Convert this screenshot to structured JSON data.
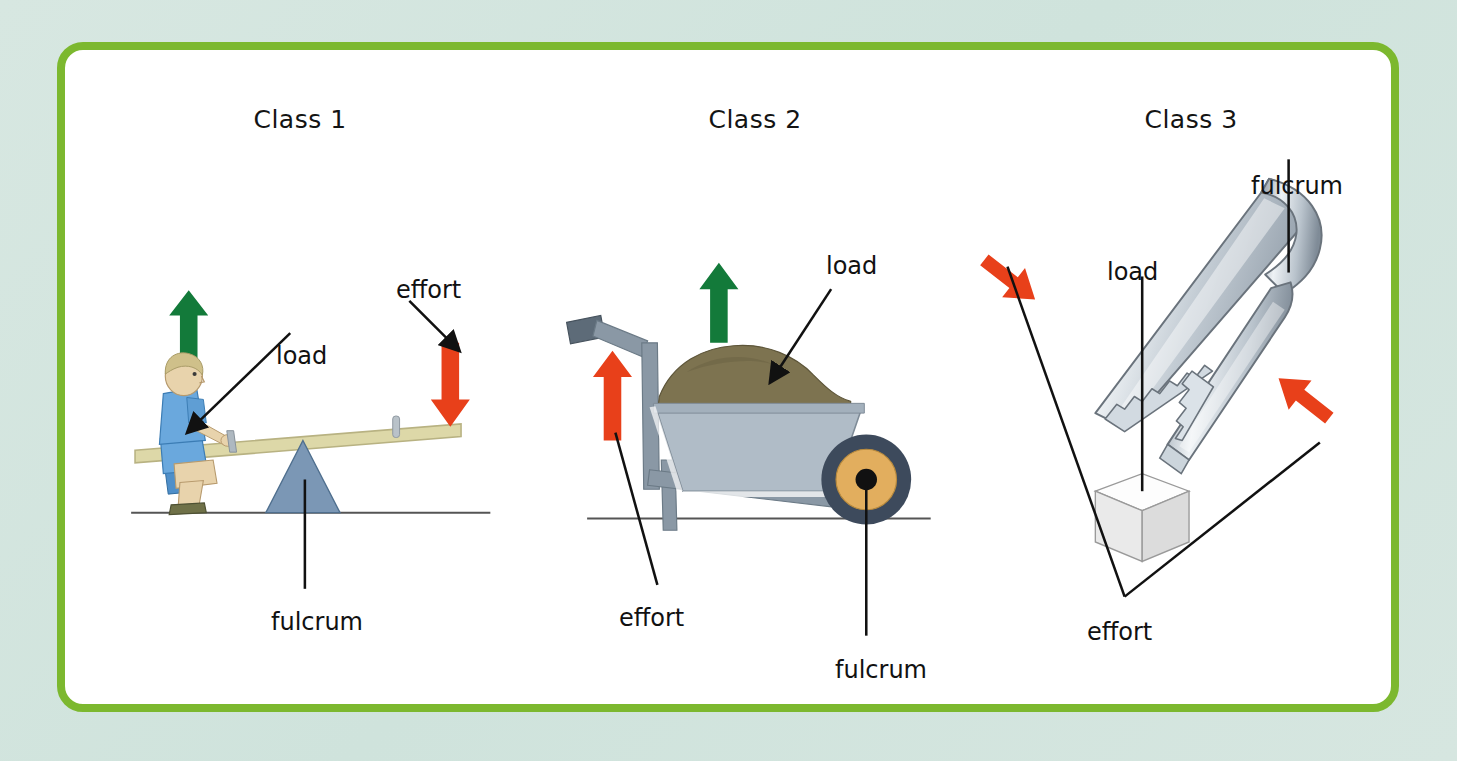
{
  "figure": {
    "kind": "levers-classification-diagram",
    "frame_color": "#7cb82f",
    "background_color": "#d4e5df",
    "canvas_color": "#ffffff",
    "load_arrow_color": "#137a3a",
    "effort_arrow_color": "#e8401a"
  },
  "panels": [
    {
      "heading": "Class 1",
      "example": "seesaw",
      "labels": {
        "load": "load",
        "effort": "effort",
        "fulcrum": "fulcrum"
      },
      "colors": {
        "plank": "#ddd8a8",
        "plank_edge": "#b9b382",
        "fulcrum": "#7b97b5",
        "fulcrum_edge": "#50708f",
        "shirt": "#6aa8dd",
        "shirt_shadow": "#4a8ac4",
        "hair": "#cfc08a",
        "skin": "#e8d3ac",
        "shoe": "#6f7148",
        "ground": "#555555"
      }
    },
    {
      "heading": "Class 2",
      "example": "wheelbarrow",
      "labels": {
        "load": "load",
        "effort": "effort",
        "fulcrum": "fulcrum"
      },
      "colors": {
        "tray": "#b0bcc7",
        "tray_edge": "#8a98a5",
        "frame": "#8a98a5",
        "handle_grip": "#5d6b78",
        "soil": "#7d7350",
        "soil_dark": "#6b6243",
        "tire": "#3d4a5c",
        "rim": "#e2ae5e",
        "hub": "#111111",
        "ground": "#555555"
      }
    },
    {
      "heading": "Class 3",
      "example": "tongs",
      "labels": {
        "load": "load",
        "effort": "effort",
        "fulcrum": "fulcrum"
      },
      "colors": {
        "metal_light": "#f2f4f6",
        "metal_mid": "#c2cbd3",
        "metal_dark": "#8e9aa6",
        "outline": "#6a737c",
        "cube_top": "#fdfdfd",
        "cube_left": "#eaeaea",
        "cube_right": "#dcdcdc",
        "cube_edge": "#9a9a9a"
      }
    }
  ]
}
